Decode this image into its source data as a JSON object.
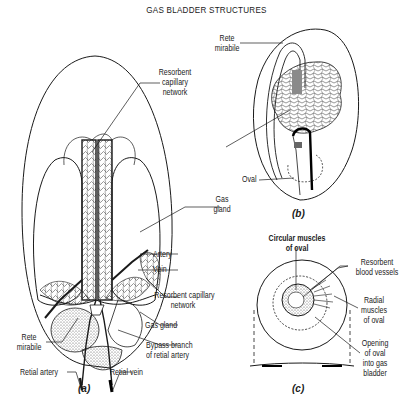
{
  "title": "GAS BLADDER STRUCTURES",
  "panels": {
    "a": {
      "label": "(a)",
      "labels": {
        "resorbent_capillary_network_top": [
          "Resorbent",
          "capillary",
          "network"
        ],
        "gas_gland_shared": [
          "Gas",
          "gland"
        ],
        "artery": "Artery",
        "vein": "Vein",
        "resorbent_capillary_network_bottom": [
          "Resorbent capillary",
          "network"
        ],
        "gas_gland": "Gas gland",
        "rete_mirabile": [
          "Rete",
          "mirabile"
        ],
        "bypass_branch": [
          "Bypass branch",
          "of retial artery"
        ],
        "retial_artery": "Retial artery",
        "retial_vein": "Retial vein"
      }
    },
    "b": {
      "label": "(b)",
      "labels": {
        "rete_mirabile": [
          "Rete",
          "mirabile"
        ],
        "oval": "Oval"
      }
    },
    "c": {
      "label": "(c)",
      "labels": {
        "circular_muscles": [
          "Circular muscles",
          "of oval"
        ],
        "resorbent_blood_vessels": [
          "Resorbent",
          "blood vessels"
        ],
        "radial_muscles": [
          "Radial",
          "muscles",
          "of oval"
        ],
        "opening": [
          "Opening",
          "of oval",
          "into gas",
          "bladder"
        ]
      }
    }
  },
  "colors": {
    "ink": "#1a1a1a",
    "paper": "#ffffff",
    "shade": "#8a8a8a"
  }
}
